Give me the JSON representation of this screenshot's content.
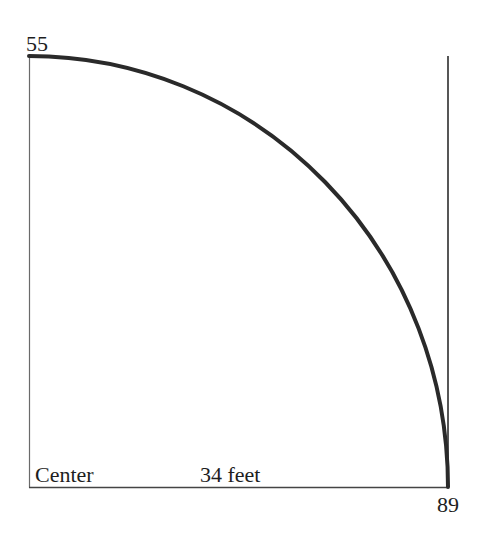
{
  "diagram": {
    "title": "",
    "labels": {
      "top_left_value": "55",
      "bottom_left_label": "Center",
      "bottom_middle_label": "34 feet",
      "bottom_right_value": "89"
    },
    "colors": {
      "background": "#ffffff",
      "frame_line": "#555555",
      "curve_line": "#2a2a2a",
      "text": "#1e1e1e"
    },
    "geometry": {
      "frame": {
        "left": 29,
        "top": 56,
        "right": 448,
        "bottom": 487
      },
      "curve": {
        "start": [
          29,
          56
        ],
        "end": [
          448,
          487
        ],
        "shape": "quarter-ellipse arc, flat at top-left, steep at bottom-right"
      }
    }
  }
}
